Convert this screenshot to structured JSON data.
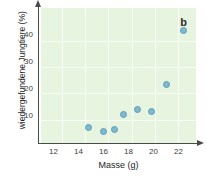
{
  "figure": {
    "panel_label": "b",
    "background_color": "#ffffff",
    "plot_background_color": "#e7f4df",
    "gridline_color": "#f7fcf4",
    "axis_color": "#4a4a4a",
    "marker_color": "#7fb8cf",
    "marker_edge_color": "#5e9fba"
  },
  "chart_data": {
    "type": "scatter",
    "title": "",
    "subtitle": "",
    "panel": "b",
    "xlabel": "Masse (g)",
    "ylabel": "wiedergefundene Jungtiere (%)",
    "xlim": [
      11.0,
      23.4
    ],
    "ylim": [
      0,
      50
    ],
    "xticks": [
      12,
      14,
      16,
      18,
      20,
      22
    ],
    "yticks": [
      10,
      20,
      30,
      40
    ],
    "xtick_labels": [
      "12",
      "14",
      "16",
      "18",
      "20",
      "22"
    ],
    "ytick_labels": [
      "10",
      "20",
      "30",
      "40"
    ],
    "grid": true,
    "legend": null,
    "legend_position": "none",
    "annotations": [
      "b"
    ],
    "series": [
      {
        "name": "wiedergefundene Jungtiere",
        "marker": "circle",
        "x": [
          14.8,
          16.0,
          16.9,
          17.6,
          18.7,
          19.8,
          21.0,
          22.4
        ],
        "y": [
          5.7,
          4.2,
          4.9,
          10.5,
          12.3,
          11.8,
          21.5,
          41.5
        ]
      }
    ]
  }
}
